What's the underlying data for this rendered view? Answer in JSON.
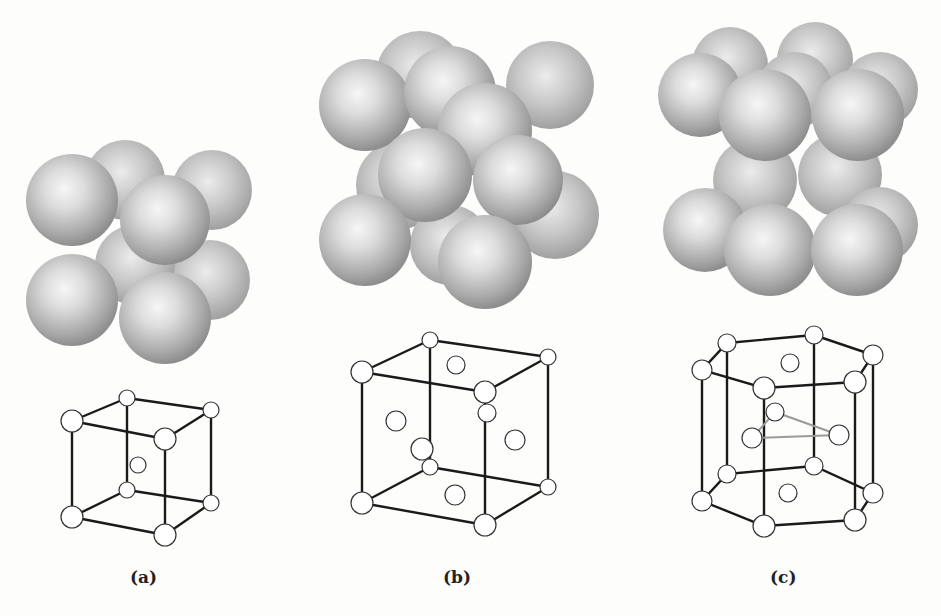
{
  "figure": {
    "panels": [
      {
        "label": "(a)",
        "structure": "body-centered cubic",
        "sphere_model": "8 corner spheres + 1 center sphere",
        "lattice_atoms": 9
      },
      {
        "label": "(b)",
        "structure": "face-centered cubic",
        "sphere_model": "8 corner spheres + 6 face-centered spheres",
        "lattice_atoms": 14
      },
      {
        "label": "(c)",
        "structure": "hexagonal close-packed",
        "sphere_model": "hexagonal layers with 3 interior spheres",
        "lattice_atoms": 17
      }
    ],
    "colors": {
      "background": "#fdfdfc",
      "sphere_light": "#f4f4f4",
      "sphere_dark": "#8c8c8c",
      "lattice_line": "#1a1a1a",
      "highlight_line": "#9a9a9a"
    }
  }
}
